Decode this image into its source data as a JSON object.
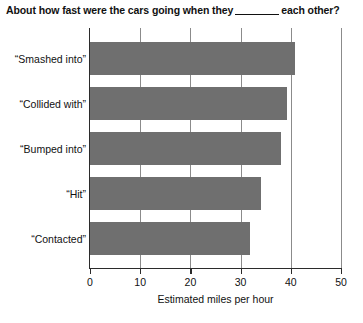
{
  "chart_data": {
    "type": "bar",
    "orientation": "horizontal",
    "title_prefix": "About how fast were the cars going when they",
    "title_suffix": "each other?",
    "categories": [
      "“Smashed into”",
      "“Collided with”",
      "“Bumped into”",
      "“Hit”",
      "“Contacted”"
    ],
    "values": [
      40.8,
      39.3,
      38.1,
      34.0,
      31.8
    ],
    "xlabel": "Estimated miles per hour",
    "ylabel": "",
    "xlim": [
      0,
      50
    ],
    "xticks": [
      0,
      10,
      20,
      30,
      40,
      50
    ],
    "xtick_labels": [
      "0",
      "10",
      "20",
      "30",
      "40",
      "50"
    ],
    "grid": "vertical",
    "legend": "none",
    "bar_color": "#6f6f6f",
    "axis_color": "#2b2b2b",
    "gridline_color": "#8b8b8b"
  }
}
